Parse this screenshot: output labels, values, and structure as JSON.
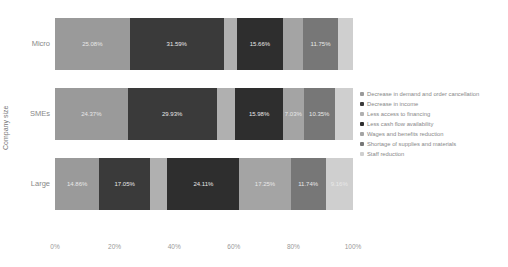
{
  "chart_data": {
    "type": "bar",
    "orientation": "horizontal",
    "stacked": "percent",
    "title": "",
    "xlabel": "",
    "ylabel": "Company size",
    "xlim": [
      0,
      100
    ],
    "x_ticks": [
      "0%",
      "20%",
      "40%",
      "60%",
      "80%",
      "100%"
    ],
    "categories": [
      "Micro",
      "SMEs",
      "Large"
    ],
    "legend_position": "right",
    "grid": false,
    "series": [
      {
        "name": "Decrease in demand and order cancellation",
        "color": "#9a9a9a",
        "values": [
          25.08,
          24.37,
          14.86
        ],
        "labels": [
          "25.08%",
          "24.37%",
          "14.86%"
        ]
      },
      {
        "name": "Decrease in income",
        "color": "#3a3a3a",
        "values": [
          31.59,
          29.93,
          17.05
        ],
        "labels": [
          "31.59%",
          "29.93%",
          "17.05%"
        ]
      },
      {
        "name": "Less access to financing",
        "color": "#b0b0b0",
        "values": [
          4.27,
          6.2,
          5.83
        ],
        "labels": [
          "",
          "",
          ""
        ]
      },
      {
        "name": "Less cash flow availability",
        "color": "#2e2e2e",
        "values": [
          15.66,
          15.98,
          24.11
        ],
        "labels": [
          "15.66%",
          "15.98%",
          "24.11%"
        ]
      },
      {
        "name": "Wages and benefits reduction",
        "color": "#a4a4a4",
        "values": [
          6.65,
          7.03,
          17.25
        ],
        "labels": [
          "",
          "7.03%",
          "17.25%"
        ]
      },
      {
        "name": "Shortage of supplies and materials",
        "color": "#777777",
        "values": [
          11.75,
          10.35,
          11.74
        ],
        "labels": [
          "11.75%",
          "10.35%",
          "11.74%"
        ]
      },
      {
        "name": "Staff reduction",
        "color": "#cfcfcf",
        "values": [
          5.0,
          6.14,
          9.16
        ],
        "labels": [
          "",
          "",
          "9.16%"
        ]
      }
    ]
  }
}
